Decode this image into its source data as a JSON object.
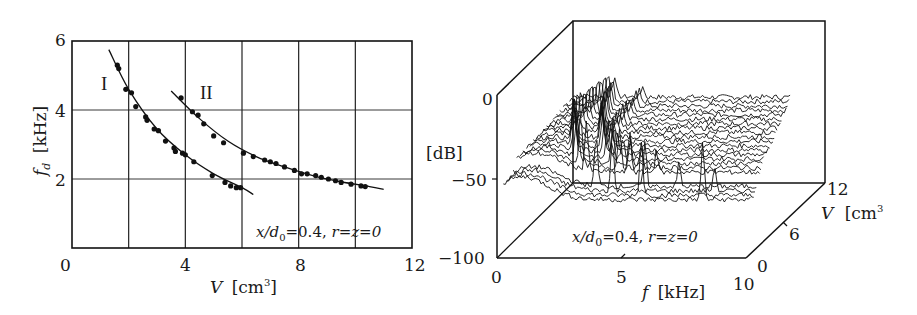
{
  "chart_data": [
    {
      "type": "scatter",
      "title": "",
      "xlabel": "V [cm³]",
      "ylabel": "f_d [kHz]",
      "xlim": [
        0,
        12
      ],
      "ylim": [
        0,
        6
      ],
      "xticks": [
        0,
        4,
        8,
        12
      ],
      "yticks": [
        2,
        4,
        6
      ],
      "grid": true,
      "annotation": "x/d0=0.4,  r=z=0",
      "series": [
        {
          "name": "I",
          "points": [
            [
              1.6,
              5.3
            ],
            [
              1.65,
              5.2
            ],
            [
              1.9,
              4.6
            ],
            [
              2.1,
              4.5
            ],
            [
              2.25,
              4.1
            ],
            [
              2.6,
              3.8
            ],
            [
              2.65,
              3.7
            ],
            [
              2.9,
              3.45
            ],
            [
              3.05,
              3.4
            ],
            [
              3.3,
              3.1
            ],
            [
              3.6,
              2.9
            ],
            [
              3.65,
              2.8
            ],
            [
              3.9,
              2.75
            ],
            [
              4.0,
              2.7
            ],
            [
              4.3,
              2.5
            ],
            [
              4.95,
              2.1
            ],
            [
              5.4,
              1.9
            ],
            [
              5.6,
              1.8
            ],
            [
              5.8,
              1.75
            ],
            [
              5.95,
              1.75
            ]
          ],
          "fit": [
            [
              1.3,
              5.75
            ],
            [
              2,
              4.6
            ],
            [
              3,
              3.45
            ],
            [
              4,
              2.7
            ],
            [
              5,
              2.15
            ],
            [
              6,
              1.75
            ],
            [
              6.4,
              1.55
            ]
          ]
        },
        {
          "name": "II",
          "points": [
            [
              3.85,
              4.35
            ],
            [
              4.25,
              3.95
            ],
            [
              4.45,
              3.85
            ],
            [
              4.65,
              3.6
            ],
            [
              5.0,
              3.25
            ],
            [
              5.35,
              3.05
            ],
            [
              6.05,
              2.75
            ],
            [
              6.4,
              2.65
            ],
            [
              6.8,
              2.55
            ],
            [
              7.0,
              2.5
            ],
            [
              7.2,
              2.45
            ],
            [
              7.5,
              2.35
            ],
            [
              7.85,
              2.25
            ],
            [
              8.1,
              2.15
            ],
            [
              8.3,
              2.15
            ],
            [
              8.6,
              2.1
            ],
            [
              8.8,
              2.05
            ],
            [
              9.05,
              2.0
            ],
            [
              9.3,
              1.95
            ],
            [
              9.5,
              1.9
            ],
            [
              9.85,
              1.85
            ],
            [
              10.2,
              1.8
            ],
            [
              10.35,
              1.78
            ]
          ],
          "fit": [
            [
              3.5,
              4.55
            ],
            [
              4.5,
              3.75
            ],
            [
              5.5,
              3.1
            ],
            [
              6.5,
              2.65
            ],
            [
              7.5,
              2.35
            ],
            [
              8.5,
              2.1
            ],
            [
              9.5,
              1.92
            ],
            [
              10.5,
              1.78
            ],
            [
              11.0,
              1.7
            ]
          ]
        }
      ],
      "series_labels": [
        "I",
        "II"
      ]
    },
    {
      "type": "surface",
      "title": "",
      "xlabel": "f [kHz]",
      "ylabel": "V [cm³]",
      "zlabel": "[dB]",
      "xlim": [
        0,
        10
      ],
      "ylim": [
        0,
        12
      ],
      "zlim": [
        -100,
        0
      ],
      "xticks": [
        0,
        5,
        10
      ],
      "yticks": [
        0,
        6,
        12
      ],
      "zticks": [
        0,
        -50,
        -100
      ],
      "annotation": "x/d0=0.4,  r=z=0",
      "description": "Waterfall of spectra: each trace is a spectrum at a given volume V; sharp peaks track the decreasing dominant frequency with V (curves I and II)",
      "n_traces": 22,
      "peaks": [
        {
          "V": 1.5,
          "f_kHz": 5.3,
          "level_dB": -8
        },
        {
          "V": 2.0,
          "f_kHz": 4.6,
          "level_dB": -20
        },
        {
          "V": 3.0,
          "f_kHz": 3.5,
          "level_dB": -30
        },
        {
          "V": 4.0,
          "f_kHz": 4.3,
          "level_dB": -25
        },
        {
          "V": 5.0,
          "f_kHz": 2.2,
          "level_dB": -40
        },
        {
          "V": 6.0,
          "f_kHz": 2.7,
          "level_dB": -40
        },
        {
          "V": 8.0,
          "f_kHz": 2.2,
          "level_dB": -45
        },
        {
          "V": 10.0,
          "f_kHz": 1.9,
          "level_dB": -48
        }
      ]
    }
  ],
  "left": {
    "xticks": [
      "0",
      "4",
      "8",
      "12"
    ],
    "yticks": [
      "2",
      "4",
      "6"
    ],
    "xlabel_var": "V",
    "xlabel_unit": "[cm",
    "xlabel_sup": "3",
    "xlabel_close": "]",
    "ylabel_var": "f",
    "ylabel_sub": "d",
    "ylabel_unit": "[kHz]",
    "label_I": "I",
    "label_II": "II",
    "annotation_a": "x/d",
    "annotation_sub": "0",
    "annotation_b": "=0.4,  ",
    "annotation_c": "r=z=0"
  },
  "right": {
    "zticks": [
      "0",
      "−50",
      "−100"
    ],
    "xticks": [
      "0",
      "5",
      "10"
    ],
    "yticks": [
      "0",
      "6",
      "12"
    ],
    "zlabel": "[dB]",
    "xlabel_var": "f",
    "xlabel_unit": "[kHz]",
    "ylabel_var": "V",
    "ylabel_unit": "[cm",
    "ylabel_sup": "3",
    "annotation_a": "x/d",
    "annotation_sub": "0",
    "annotation_b": "=0.4,  ",
    "annotation_c": "r=z=0"
  }
}
